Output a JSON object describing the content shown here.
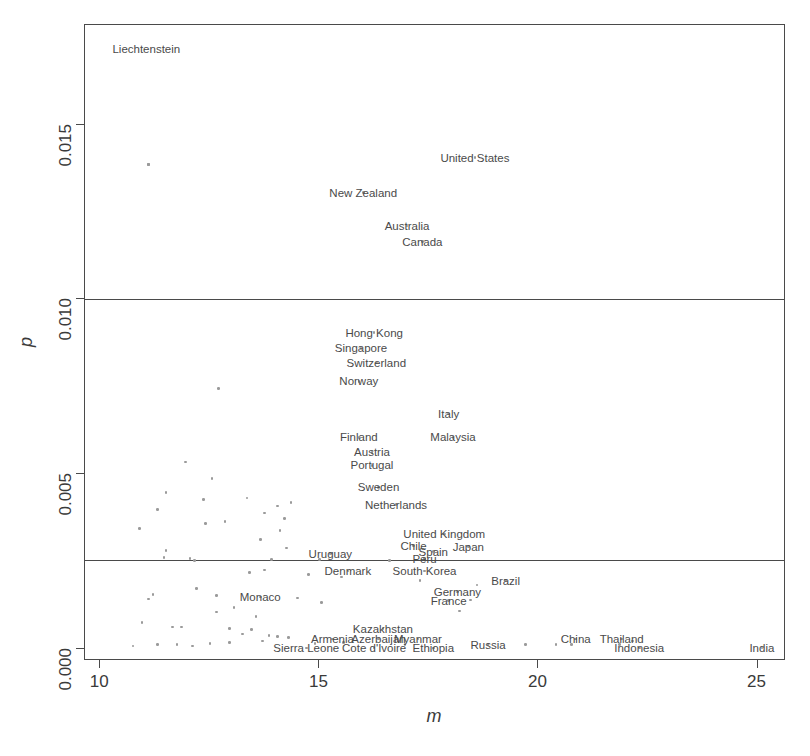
{
  "chart_data": {
    "type": "scatter",
    "title": "",
    "xlabel": "m",
    "ylabel": "p",
    "xlim": [
      9.65,
      25.65
    ],
    "ylim": [
      -0.00035,
      0.01785
    ],
    "xticks": [
      10,
      15,
      20,
      25
    ],
    "xtick_labels": [
      "10",
      "15",
      "20",
      "25"
    ],
    "yticks": [
      0.0,
      0.005,
      0.01,
      0.015
    ],
    "ytick_labels": [
      "0.000",
      "0.005",
      "0.010",
      "0.015"
    ],
    "grid": false,
    "legend": null,
    "hlines": [
      0.01,
      0.00255
    ],
    "labeled_points": [
      {
        "label": "Liechtenstein",
        "m": 11.1,
        "p": 0.01385,
        "lx": 11.05,
        "ly": 0.01715
      },
      {
        "label": "United States",
        "m": 18.55,
        "p": 0.01405,
        "lx": 18.55,
        "ly": 0.01405
      },
      {
        "label": "New Zealand",
        "m": 16.0,
        "p": 0.01305,
        "lx": 16.0,
        "ly": 0.01305
      },
      {
        "label": "Australia",
        "m": 17.0,
        "p": 0.0121,
        "lx": 17.0,
        "ly": 0.0121
      },
      {
        "label": "Canada",
        "m": 17.35,
        "p": 0.01165,
        "lx": 17.35,
        "ly": 0.01165
      },
      {
        "label": "Hong Kong",
        "m": 16.25,
        "p": 0.00905,
        "lx": 16.25,
        "ly": 0.00905
      },
      {
        "label": "Singapore",
        "m": 15.95,
        "p": 0.0086,
        "lx": 15.95,
        "ly": 0.0086
      },
      {
        "label": "Switzerland",
        "m": 16.3,
        "p": 0.00818,
        "lx": 16.3,
        "ly": 0.00818
      },
      {
        "label": "Norway",
        "m": 15.9,
        "p": 0.00765,
        "lx": 15.9,
        "ly": 0.00765
      },
      {
        "label": "Italy",
        "m": 17.95,
        "p": 0.00672,
        "lx": 17.95,
        "ly": 0.00672
      },
      {
        "label": "Malaysia",
        "m": 18.05,
        "p": 0.00605,
        "lx": 18.05,
        "ly": 0.00605
      },
      {
        "label": "Finland",
        "m": 15.9,
        "p": 0.00605,
        "lx": 15.9,
        "ly": 0.00605
      },
      {
        "label": "Austria",
        "m": 16.2,
        "p": 0.00562,
        "lx": 16.2,
        "ly": 0.00562
      },
      {
        "label": "Portugal",
        "m": 16.2,
        "p": 0.00525,
        "lx": 16.2,
        "ly": 0.00525
      },
      {
        "label": "Sweden",
        "m": 16.35,
        "p": 0.00462,
        "lx": 16.35,
        "ly": 0.00462
      },
      {
        "label": "Netherlands",
        "m": 16.75,
        "p": 0.00412,
        "lx": 16.75,
        "ly": 0.00412
      },
      {
        "label": "United Kingdom",
        "m": 17.85,
        "p": 0.00328,
        "lx": 17.85,
        "ly": 0.00328
      },
      {
        "label": "Chile",
        "m": 17.15,
        "p": 0.00295,
        "lx": 17.15,
        "ly": 0.00295
      },
      {
        "label": "Spain",
        "m": 17.6,
        "p": 0.00278,
        "lx": 17.6,
        "ly": 0.00278
      },
      {
        "label": "Japan",
        "m": 18.4,
        "p": 0.00292,
        "lx": 18.4,
        "ly": 0.00292
      },
      {
        "label": "Peru",
        "m": 17.4,
        "p": 0.00258,
        "lx": 17.4,
        "ly": 0.00258
      },
      {
        "label": "Uruguay",
        "m": 15.25,
        "p": 0.00272,
        "lx": 15.25,
        "ly": 0.00272
      },
      {
        "label": "Denmark",
        "m": 15.65,
        "p": 0.00222,
        "lx": 15.65,
        "ly": 0.00222
      },
      {
        "label": "South Korea",
        "m": 17.4,
        "p": 0.00222,
        "lx": 17.4,
        "ly": 0.00222
      },
      {
        "label": "Brazil",
        "m": 19.25,
        "p": 0.00195,
        "lx": 19.25,
        "ly": 0.00195
      },
      {
        "label": "Germany",
        "m": 18.15,
        "p": 0.00162,
        "lx": 18.15,
        "ly": 0.00162
      },
      {
        "label": "France",
        "m": 17.95,
        "p": 0.00138,
        "lx": 17.95,
        "ly": 0.00138
      },
      {
        "label": "Monaco",
        "m": 13.65,
        "p": 0.00148,
        "lx": 13.65,
        "ly": 0.00148
      },
      {
        "label": "Kazakhstan",
        "m": 16.45,
        "p": 0.00058,
        "lx": 16.45,
        "ly": 0.00058
      },
      {
        "label": "Armenia",
        "m": 15.3,
        "p": 0.00028,
        "lx": 15.3,
        "ly": 0.00028
      },
      {
        "label": "Azerbaijan",
        "m": 16.35,
        "p": 0.00028,
        "lx": 16.35,
        "ly": 0.00028
      },
      {
        "label": "Myanmar",
        "m": 17.25,
        "p": 0.00028,
        "lx": 17.25,
        "ly": 0.00028
      },
      {
        "label": "Russia",
        "m": 18.85,
        "p": 0.00012,
        "lx": 18.85,
        "ly": 0.00012
      },
      {
        "label": "Sierra Leone",
        "m": 14.7,
        "p": 2e-05,
        "lx": 14.7,
        "ly": 2e-05
      },
      {
        "label": "Cote d'Ivoire",
        "m": 16.25,
        "p": 2e-05,
        "lx": 16.25,
        "ly": 2e-05
      },
      {
        "label": "Ethiopia",
        "m": 17.6,
        "p": 2e-05,
        "lx": 17.6,
        "ly": 2e-05
      },
      {
        "label": "China",
        "m": 20.85,
        "p": 0.00028,
        "lx": 20.85,
        "ly": 0.00028
      },
      {
        "label": "Thailand",
        "m": 21.9,
        "p": 0.00028,
        "lx": 21.9,
        "ly": 0.00028
      },
      {
        "label": "Indonesia",
        "m": 22.3,
        "p": 2e-05,
        "lx": 22.3,
        "ly": 2e-05
      },
      {
        "label": "India",
        "m": 25.1,
        "p": 2e-05,
        "lx": 25.1,
        "ly": 2e-05
      }
    ],
    "unlabeled_points": [
      {
        "m": 11.1,
        "p": 0.01385
      },
      {
        "m": 12.7,
        "p": 0.00745
      },
      {
        "m": 11.95,
        "p": 0.00535
      },
      {
        "m": 12.55,
        "p": 0.00488
      },
      {
        "m": 11.5,
        "p": 0.00448
      },
      {
        "m": 12.35,
        "p": 0.00428
      },
      {
        "m": 11.3,
        "p": 0.00398
      },
      {
        "m": 13.35,
        "p": 0.00432
      },
      {
        "m": 14.05,
        "p": 0.00408
      },
      {
        "m": 14.35,
        "p": 0.00418
      },
      {
        "m": 13.75,
        "p": 0.00388
      },
      {
        "m": 14.2,
        "p": 0.00372
      },
      {
        "m": 12.85,
        "p": 0.00365
      },
      {
        "m": 12.4,
        "p": 0.00358
      },
      {
        "m": 10.9,
        "p": 0.00345
      },
      {
        "m": 14.1,
        "p": 0.00338
      },
      {
        "m": 13.65,
        "p": 0.00312
      },
      {
        "m": 14.25,
        "p": 0.00288
      },
      {
        "m": 11.5,
        "p": 0.00282
      },
      {
        "m": 11.45,
        "p": 0.00262
      },
      {
        "m": 12.05,
        "p": 0.00258
      },
      {
        "m": 12.15,
        "p": 0.00252
      },
      {
        "m": 13.9,
        "p": 0.00255
      },
      {
        "m": 15.0,
        "p": 0.00255
      },
      {
        "m": 16.6,
        "p": 0.00252
      },
      {
        "m": 13.4,
        "p": 0.00218
      },
      {
        "m": 13.75,
        "p": 0.00225
      },
      {
        "m": 14.75,
        "p": 0.00212
      },
      {
        "m": 15.5,
        "p": 0.00205
      },
      {
        "m": 17.3,
        "p": 0.00195
      },
      {
        "m": 18.6,
        "p": 0.00182
      },
      {
        "m": 18.45,
        "p": 0.0014
      },
      {
        "m": 12.2,
        "p": 0.00172
      },
      {
        "m": 11.2,
        "p": 0.00155
      },
      {
        "m": 11.1,
        "p": 0.00142
      },
      {
        "m": 12.65,
        "p": 0.00152
      },
      {
        "m": 14.5,
        "p": 0.00145
      },
      {
        "m": 15.05,
        "p": 0.00132
      },
      {
        "m": 13.05,
        "p": 0.00118
      },
      {
        "m": 12.65,
        "p": 0.00105
      },
      {
        "m": 13.55,
        "p": 0.00092
      },
      {
        "m": 18.2,
        "p": 0.00108
      },
      {
        "m": 10.95,
        "p": 0.00075
      },
      {
        "m": 11.65,
        "p": 0.00062
      },
      {
        "m": 11.85,
        "p": 0.00062
      },
      {
        "m": 12.95,
        "p": 0.00058
      },
      {
        "m": 13.45,
        "p": 0.00055
      },
      {
        "m": 13.25,
        "p": 0.00042
      },
      {
        "m": 13.85,
        "p": 0.00038
      },
      {
        "m": 14.05,
        "p": 0.00035
      },
      {
        "m": 14.3,
        "p": 0.00032
      },
      {
        "m": 13.7,
        "p": 0.00022
      },
      {
        "m": 12.95,
        "p": 0.00018
      },
      {
        "m": 12.5,
        "p": 0.00015
      },
      {
        "m": 11.3,
        "p": 0.00012
      },
      {
        "m": 11.75,
        "p": 0.00012
      },
      {
        "m": 10.75,
        "p": 8e-05
      },
      {
        "m": 12.1,
        "p": 8e-05
      },
      {
        "m": 14.9,
        "p": 0.00015
      },
      {
        "m": 15.55,
        "p": 0.00018
      },
      {
        "m": 16.95,
        "p": 0.00012
      },
      {
        "m": 19.7,
        "p": 0.00012
      },
      {
        "m": 20.4,
        "p": 0.00012
      },
      {
        "m": 20.75,
        "p": 0.00012
      },
      {
        "m": 21.85,
        "p": 0.00012
      },
      {
        "m": 22.15,
        "p": 0.00022
      }
    ]
  }
}
